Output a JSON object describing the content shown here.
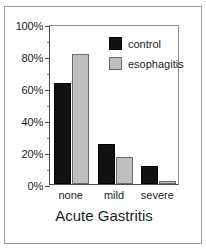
{
  "chart_data": {
    "type": "bar",
    "title": "",
    "xlabel": "Acute Gastritis",
    "ylabel": "",
    "categories": [
      "none",
      "mild",
      "severe"
    ],
    "series": [
      {
        "name": "control",
        "color": "#111111",
        "values": [
          63,
          25,
          11
        ]
      },
      {
        "name": "esophagitis",
        "color": "#bfbfbf",
        "values": [
          81,
          17,
          2
        ]
      }
    ],
    "ylim": [
      0,
      100
    ],
    "y_tick_labels": [
      "0%",
      "20%",
      "40%",
      "60%",
      "80%",
      "100%"
    ],
    "y_tick_values": [
      0,
      20,
      40,
      60,
      80,
      100
    ],
    "y_minor_tick_values": [
      10,
      30,
      50,
      70,
      90
    ],
    "grid": false,
    "legend_position": "top-right",
    "value_suffix": "%"
  },
  "legend": {
    "entries": [
      {
        "label": "control"
      },
      {
        "label": "esophagitis"
      }
    ]
  },
  "axis": {
    "x_title": "Acute Gastritis"
  }
}
